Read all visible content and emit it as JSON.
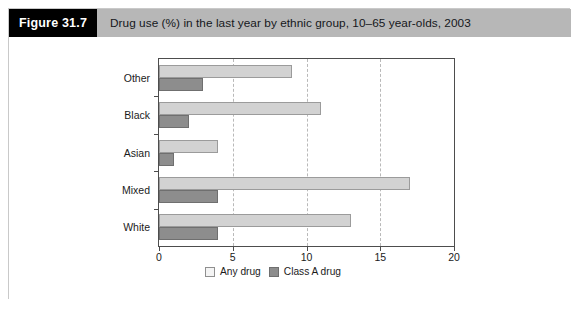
{
  "figure": {
    "number_label": "Figure 31.7",
    "caption": "Drug use (%) in the last year by ethnic group, 10–65 year-olds, 2003"
  },
  "legend": {
    "position": "bottom-left",
    "items": [
      {
        "label": "Any drug",
        "swatch": "light-gray-swatch",
        "color": "#f4f4f4"
      },
      {
        "label": "Class A drug",
        "swatch": "dark-gray-swatch",
        "color": "#8d8d8d"
      }
    ]
  },
  "chart_data": {
    "type": "bar",
    "orientation": "horizontal",
    "title": "Drug use (%) in the last year by ethnic group, 10–65 year-olds, 2003",
    "xlabel": "",
    "ylabel": "",
    "xlim": [
      0,
      20
    ],
    "ylim": null,
    "grid": true,
    "grid_axis": "x",
    "xticks": [
      "0",
      "5",
      "10",
      "15",
      "20"
    ],
    "xtick_values": [
      0,
      5,
      10,
      15,
      20
    ],
    "categories": [
      "White",
      "Mixed",
      "Asian",
      "Black",
      "Other"
    ],
    "category_order_top_to_bottom": [
      "Other",
      "Black",
      "Asian",
      "Mixed",
      "White"
    ],
    "series": [
      {
        "name": "Any drug",
        "color": "#d2d2d2",
        "values": [
          13,
          17,
          4,
          11,
          9
        ]
      },
      {
        "name": "Class A drug",
        "color": "#8d8d8d",
        "values": [
          4,
          4,
          1,
          2,
          3
        ]
      }
    ]
  }
}
